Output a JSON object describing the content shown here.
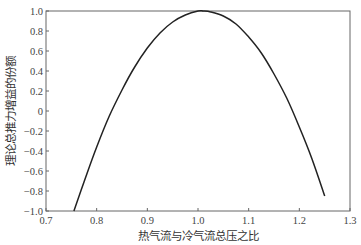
{
  "chart_data": {
    "type": "line",
    "title": "",
    "xlabel": "热气流与冷气流总压之比",
    "ylabel": "理论总推力增益的份额",
    "xlim": [
      0.7,
      1.3
    ],
    "ylim": [
      -1.0,
      1.0
    ],
    "xticks": [
      "0.7",
      "0.8",
      "0.9",
      "1.0",
      "1.1",
      "1.2",
      "1.3"
    ],
    "yticks": [
      "1.0",
      "0.8",
      "0.6",
      "0.4",
      "0.2",
      "0",
      "-0.2",
      "-0.4",
      "-0.6",
      "-0.8",
      "-1.0"
    ],
    "grid": false,
    "legend": null,
    "series": [
      {
        "name": "thrust gain fraction",
        "color": "#222222",
        "x": [
          0.755,
          0.775,
          0.8,
          0.825,
          0.85,
          0.875,
          0.9,
          0.925,
          0.95,
          0.975,
          1.0,
          1.01,
          1.025,
          1.05,
          1.075,
          1.1,
          1.125,
          1.15,
          1.175,
          1.2,
          1.225,
          1.25
        ],
        "y": [
          -1.0,
          -0.71,
          -0.36,
          -0.05,
          0.21,
          0.44,
          0.63,
          0.78,
          0.89,
          0.96,
          1.0,
          1.0,
          0.99,
          0.95,
          0.87,
          0.74,
          0.58,
          0.37,
          0.13,
          -0.16,
          -0.48,
          -0.85
        ]
      }
    ]
  }
}
